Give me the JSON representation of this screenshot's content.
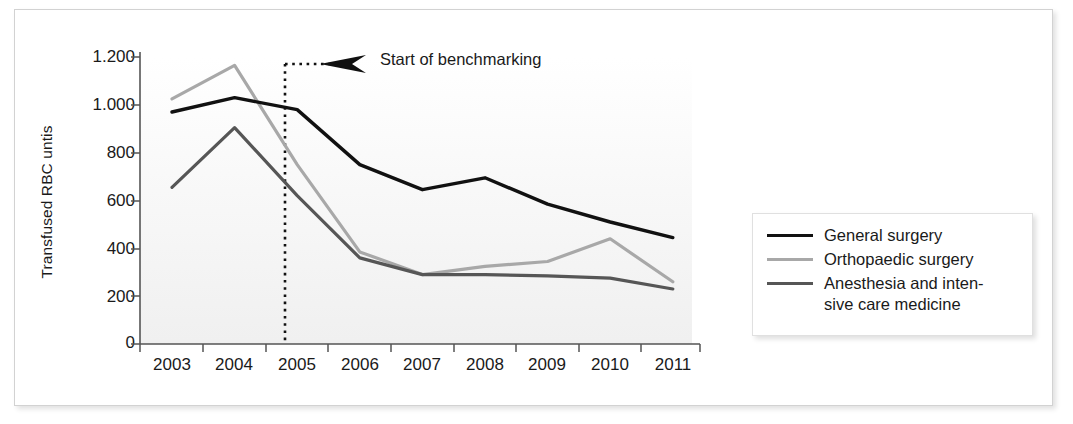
{
  "chart_data": {
    "type": "line",
    "title": "",
    "xlabel": "",
    "ylabel": "Transfused RBC untis",
    "x": [
      "2003",
      "2004",
      "2005",
      "2006",
      "2007",
      "2008",
      "2009",
      "2010",
      "2011"
    ],
    "categories": [
      "2003",
      "2004",
      "2005",
      "2006",
      "2007",
      "2008",
      "2009",
      "2010",
      "2011"
    ],
    "ylim": [
      0,
      1200
    ],
    "yticks": [
      0,
      200,
      400,
      600,
      800,
      1000,
      1200
    ],
    "ytick_labels": [
      "0",
      "200",
      "400",
      "600",
      "800",
      "1.000",
      "1.200"
    ],
    "grid": false,
    "legend_position": "right",
    "series": [
      {
        "name": "General surgery",
        "color": "#111111",
        "values": [
          970,
          1030,
          980,
          750,
          645,
          695,
          585,
          510,
          445
        ]
      },
      {
        "name": "Orthopaedic surgery",
        "color": "#a8a8a8",
        "values": [
          1025,
          1165,
          750,
          385,
          290,
          325,
          345,
          440,
          260
        ]
      },
      {
        "name": "Anesthesia and inten-sive care medicine",
        "color": "#565656",
        "values": [
          655,
          905,
          620,
          360,
          290,
          290,
          285,
          275,
          230
        ]
      }
    ],
    "annotations": [
      {
        "text": "Start of benchmarking",
        "type": "vertical-dotted-line-with-arrow",
        "x_value": 2004.65,
        "color": "#111111"
      }
    ]
  },
  "axes": {
    "y_title": "Transfused RBC untis",
    "y_ticks": [
      "1.200",
      "1.000",
      "800",
      "600",
      "400",
      "200",
      "0"
    ],
    "x_ticks": [
      "2003",
      "2004",
      "2005",
      "2006",
      "2007",
      "2008",
      "2009",
      "2010",
      "2011"
    ]
  },
  "annotation": {
    "label": "Start of benchmarking"
  },
  "legend": {
    "items": [
      {
        "label": "General surgery",
        "color": "#111111"
      },
      {
        "label": "Orthopaedic surgery",
        "color": "#a8a8a8"
      },
      {
        "label": "Anesthesia and inten-",
        "label2": "sive care medicine",
        "color": "#565656"
      }
    ]
  },
  "colors": {
    "general_surgery": "#111111",
    "orthopaedic_surgery": "#a8a8a8",
    "anesthesia": "#565656",
    "axis": "#555555",
    "text": "#1a1a1a",
    "frame": "#d2d2d2"
  }
}
